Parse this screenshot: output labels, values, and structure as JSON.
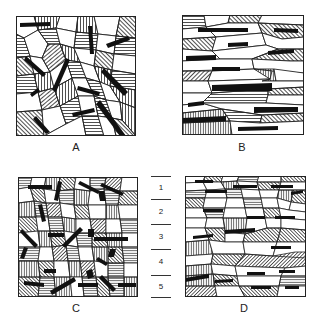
{
  "figure": {
    "panels": [
      {
        "id": "A",
        "label": "A",
        "texture": "equiaxed grains with randomly oriented rods"
      },
      {
        "id": "B",
        "label": "B",
        "texture": "elongated grains with horizontally aligned rods"
      },
      {
        "id": "C",
        "label": "C",
        "texture": "fine equiaxed grains with random rods"
      },
      {
        "id": "D",
        "label": "D",
        "texture": "fine elongated grains with horizontal rods"
      }
    ],
    "scale": {
      "levels": [
        "1",
        "2",
        "3",
        "4",
        "5"
      ]
    }
  },
  "colors": {
    "ink": "#1a1a1a",
    "background": "#ffffff"
  }
}
